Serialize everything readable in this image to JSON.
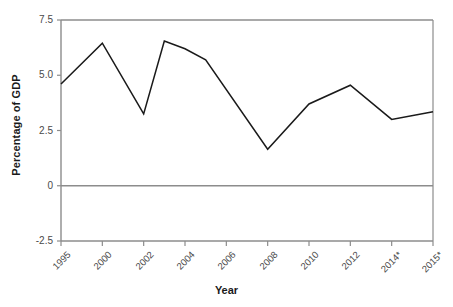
{
  "chart_data": {
    "type": "line",
    "title": "",
    "xlabel": "Year",
    "ylabel": "Percentage of GDP",
    "ylim": [
      -2.5,
      7.5
    ],
    "yticks": [
      "7.5",
      "5.0",
      "2.5",
      "0",
      "-2.5"
    ],
    "ytick_values": [
      7.5,
      5.0,
      2.5,
      0,
      -2.5
    ],
    "grid": false,
    "legend": "none",
    "x": [
      1995,
      2000,
      2002,
      2003,
      2004,
      2005,
      2008,
      2010,
      2012,
      2014,
      2015
    ],
    "categories": [
      "1995",
      "2000",
      "2002",
      "2003",
      "2004",
      "2005",
      "2008",
      "2010",
      "2012",
      "2014*",
      "2015*"
    ],
    "xtick_labels": [
      "1995",
      "2000",
      "2002",
      "2004",
      "2006",
      "2008",
      "2010",
      "2012",
      "2014*",
      "2015*"
    ],
    "xtick_values": [
      1995,
      2000,
      2002,
      2004,
      2006,
      2008,
      2010,
      2012,
      2014,
      2015
    ],
    "values": [
      4.6,
      6.45,
      3.25,
      6.55,
      6.2,
      5.7,
      1.65,
      3.7,
      4.55,
      3.0,
      3.35
    ],
    "series": [
      {
        "name": "Percentage of GDP",
        "values": [
          4.6,
          6.45,
          3.25,
          6.55,
          6.2,
          5.7,
          1.65,
          3.7,
          4.55,
          3.0,
          3.35
        ],
        "color": "#1a1a1a"
      }
    ],
    "line_color": "#1a1a1a",
    "axis_color": "#8c8c8c",
    "background_color": "#ffffff"
  }
}
